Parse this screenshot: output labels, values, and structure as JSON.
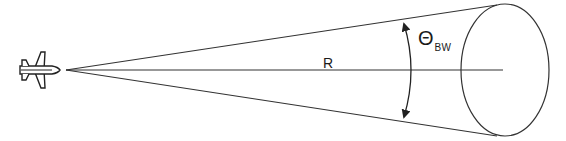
{
  "diagram": {
    "labels": {
      "range": "R",
      "beamwidth_symbol": "Θ",
      "beamwidth_subscript": "BW"
    },
    "elements": {
      "aircraft": "airplane-icon",
      "beam_cone": "cone",
      "beam_footprint": "ellipse",
      "beamwidth_arc": "double-arrow-arc"
    },
    "colors": {
      "stroke": "#333333",
      "background": "#ffffff"
    }
  }
}
